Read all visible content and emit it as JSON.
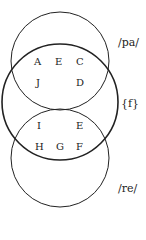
{
  "diagram": {
    "type": "venn",
    "sets": [
      {
        "id": "pa",
        "label": "/pa/"
      },
      {
        "id": "f",
        "label": "{f}"
      },
      {
        "id": "re",
        "label": "/re/"
      }
    ],
    "regions": {
      "pa_and_f": [
        "A",
        "E",
        "C",
        "J",
        "D"
      ],
      "f_and_re": [
        "I",
        "E",
        "H",
        "G",
        "F"
      ]
    },
    "letters": {
      "a": "A",
      "e1": "E",
      "c": "C",
      "j": "J",
      "d": "D",
      "i": "I",
      "e2": "E",
      "h": "H",
      "g": "G",
      "f": "F"
    },
    "colors": {
      "stroke": "#222222",
      "background": "#ffffff"
    }
  }
}
